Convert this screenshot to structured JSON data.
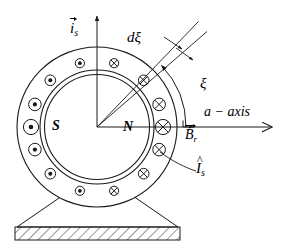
{
  "figure": {
    "type": "cross-section-schematic",
    "background_color": "#ffffff",
    "line_color": "#1a1a1a"
  },
  "labels": {
    "stator_current_vector": {
      "base": "i",
      "sub": "s",
      "accent": "arrow",
      "text": "i_s"
    },
    "differential_angle": {
      "text": "d",
      "symbol": "ξ"
    },
    "angle": {
      "symbol": "ξ"
    },
    "axis": {
      "text": "a − axis"
    },
    "rotor_flux_vector": {
      "base": "B",
      "sub": "r",
      "accent": "arrow",
      "text": "B_r"
    },
    "south_pole": {
      "text": "S"
    },
    "north_pole": {
      "text": "N"
    },
    "conductor_current": {
      "base": "I",
      "sub": "s",
      "accent": "hat",
      "text": "I_s"
    }
  },
  "geometry": {
    "center": {
      "x": 97,
      "y": 127
    },
    "outer_radius": 80,
    "stator_bore_radius": 57,
    "rotor_radius": 52,
    "conductor_ring_radius": 66,
    "conductor_count": 12,
    "conductor_radius_large": 7.5,
    "conductor_radius_small": 4.5,
    "ray_angle_deg": 43,
    "wedge_angle_deg": 5,
    "xi_arc_radius": 88,
    "a_axis_end_x": 276,
    "is_axis_top_y": 13
  },
  "conductors": [
    {
      "index": 0,
      "angle_deg": 105,
      "marker": "dot",
      "size": "small"
    },
    {
      "index": 1,
      "angle_deg": 135,
      "marker": "dot",
      "size": "small"
    },
    {
      "index": 2,
      "angle_deg": 160,
      "marker": "dot",
      "size": "medium"
    },
    {
      "index": 3,
      "angle_deg": 180,
      "marker": "dot",
      "size": "large"
    },
    {
      "index": 4,
      "angle_deg": 200,
      "marker": "dot",
      "size": "medium"
    },
    {
      "index": 5,
      "angle_deg": 225,
      "marker": "dot",
      "size": "small"
    },
    {
      "index": 6,
      "angle_deg": 255,
      "marker": "dot",
      "size": "small"
    },
    {
      "index": 7,
      "angle_deg": 285,
      "marker": "cross",
      "size": "small"
    },
    {
      "index": 8,
      "angle_deg": 315,
      "marker": "cross",
      "size": "small"
    },
    {
      "index": 9,
      "angle_deg": 340,
      "marker": "cross",
      "size": "medium"
    },
    {
      "index": 10,
      "angle_deg": 0,
      "marker": "cross",
      "size": "large"
    },
    {
      "index": 11,
      "angle_deg": 20,
      "marker": "cross",
      "size": "medium"
    },
    {
      "index": 12,
      "angle_deg": 45,
      "marker": "cross",
      "size": "small"
    },
    {
      "index": 13,
      "angle_deg": 75,
      "marker": "cross",
      "size": "small"
    }
  ],
  "base": {
    "pedestal_top_left_x": 62,
    "pedestal_top_right_x": 133,
    "pedestal_bottom_left_x": 17,
    "pedestal_bottom_right_x": 178,
    "pedestal_top_y": 198,
    "foundation_top_y": 227,
    "foundation_bottom_y": 240,
    "hatch": true
  },
  "annotations": {
    "dxi_leader_count": 2,
    "is_hat_leader": true,
    "xi_arc_arrow": "counterclockwise-end",
    "a_axis_arrow": "right",
    "is_arrow": "up",
    "br_arrow": "right"
  }
}
